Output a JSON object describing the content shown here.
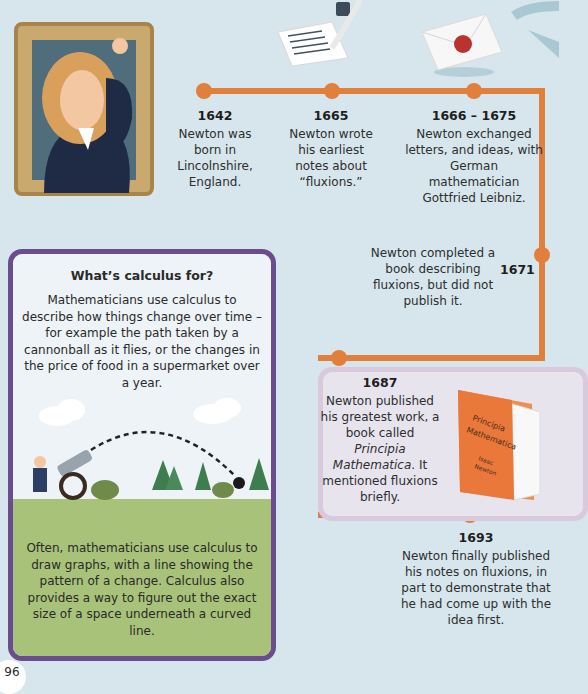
{
  "colors": {
    "background": "#d7e6ec",
    "timeline": "#e0803c",
    "calc_box_border": "#6a4c8f",
    "lower_panel": "#e7e4ee",
    "grass": "#a9c27a"
  },
  "illustrations": {
    "portrait": "newton-portrait",
    "quill": "quill-and-paper",
    "letter": "sealed-envelope",
    "arrow": "curved-arrow",
    "book": "principia-book",
    "cannon_scene": "cannon-trajectory"
  },
  "book": {
    "title_line1": "Principia",
    "title_line2": "Mathematica",
    "author_line1": "Isaac",
    "author_line2": "Newton"
  },
  "timeline": [
    {
      "year": "1642",
      "text": "Newton was born in Lincolnshire, England."
    },
    {
      "year": "1665",
      "text": "Newton wrote his earliest notes about “fluxions.”"
    },
    {
      "year": "1666 – 1675",
      "text": "Newton exchanged letters, and ideas, with German mathematician Gottfried Leibniz."
    },
    {
      "year": "1671",
      "text": "Newton completed a book describing fluxions, but did not publish it."
    },
    {
      "year": "1687",
      "text_pre": "Newton published his greatest work, a book called ",
      "text_italic": "Principia Mathematica",
      "text_post": ". It mentioned fluxions briefly."
    },
    {
      "year": "1693",
      "text": "Newton finally published his notes on fluxions, in part to demonstrate that he had come up with the idea first."
    }
  ],
  "calculus_box": {
    "title": "What’s calculus for?",
    "intro": "Mathematicians use calculus to describe how things change over time – for example the path taken by a cannonball as it flies, or the changes in the price of food in a supermarket over a year.",
    "body": "Often, mathematicians use calculus to draw graphs, with a line showing the pattern of a change. Calculus also provides a way to figure out the exact size of a space underneath a curved line."
  },
  "page_number": "96"
}
